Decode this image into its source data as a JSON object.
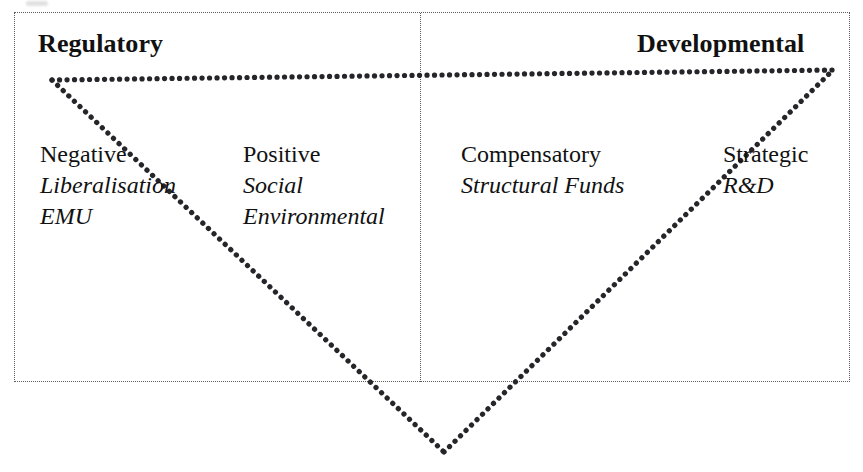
{
  "diagram": {
    "title_left": "Regulatory",
    "title_right": "Developmental",
    "columns": [
      {
        "id": "negative",
        "heading": "Negative",
        "items": [
          "Liberalisation",
          "EMU"
        ]
      },
      {
        "id": "positive",
        "heading": "Positive",
        "items": [
          "Social",
          "Environmental"
        ]
      },
      {
        "id": "compensatory",
        "heading": "Compensatory",
        "items": [
          "Structural Funds"
        ]
      },
      {
        "id": "strategic",
        "heading": "Strategic",
        "items": [
          "R&D"
        ]
      }
    ],
    "colors": {
      "text": "#111111",
      "frame_line": "#5a5a5a",
      "vector_line": "#26262a",
      "background": "#ffffff"
    }
  }
}
